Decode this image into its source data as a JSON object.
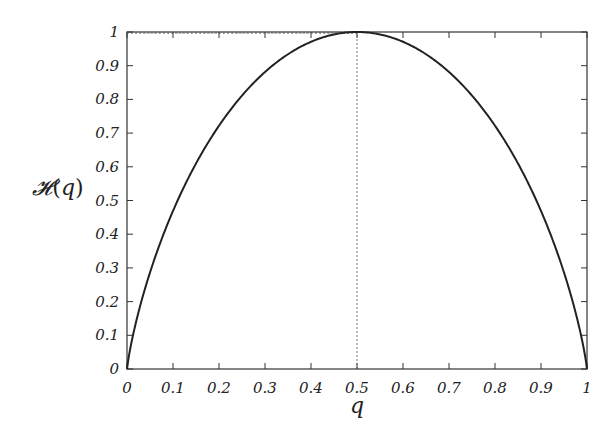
{
  "chart_data": {
    "type": "line",
    "title": "",
    "xlabel": "q",
    "ylabel": "𝓗(q)",
    "xlim": [
      0,
      1
    ],
    "ylim": [
      0,
      1
    ],
    "grid": false,
    "legend": null,
    "x_ticks": [
      "0",
      "0.1",
      "0.2",
      "0.3",
      "0.4",
      "0.5",
      "0.6",
      "0.7",
      "0.8",
      "0.9",
      "1"
    ],
    "y_ticks": [
      "0",
      "0.1",
      "0.2",
      "0.3",
      "0.4",
      "0.5",
      "0.6",
      "0.7",
      "0.8",
      "0.9",
      "1"
    ],
    "series": [
      {
        "name": "binary entropy H(q) = -q log2 q - (1-q) log2 (1-q)",
        "x": [
          0,
          0.01,
          0.05,
          0.1,
          0.15,
          0.2,
          0.25,
          0.3,
          0.35,
          0.4,
          0.45,
          0.5,
          0.55,
          0.6,
          0.65,
          0.7,
          0.75,
          0.8,
          0.85,
          0.9,
          0.95,
          0.99,
          1
        ],
        "values": [
          0,
          0.081,
          0.286,
          0.469,
          0.61,
          0.722,
          0.811,
          0.881,
          0.934,
          0.971,
          0.993,
          1.0,
          0.993,
          0.971,
          0.934,
          0.881,
          0.811,
          0.722,
          0.61,
          0.469,
          0.286,
          0.081,
          0
        ]
      }
    ],
    "annotations": [
      {
        "type": "dotted-vertical-line",
        "x": 0.5,
        "from_y": 0,
        "to_y": 1
      },
      {
        "type": "dotted-horizontal-line",
        "y": 1,
        "from_x": 0,
        "to_x": 0.5
      }
    ],
    "colors": {
      "line": "#222222",
      "frame": "#333333",
      "guide": "#555555"
    }
  }
}
